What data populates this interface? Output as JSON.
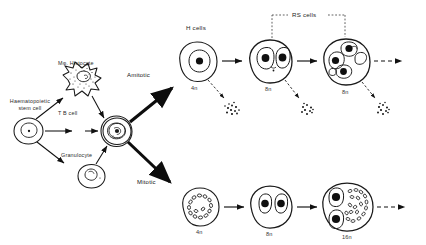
{
  "figure": {
    "type": "cell-lineage-diagram",
    "background_color": "#ffffff",
    "ink_color": "#1a1a1a"
  },
  "labels": {
    "stem_cell_line1": "Haematopoietic",
    "stem_cell_line2": "stem cell",
    "histocyte": "Mφ. Histocyte",
    "tb_cell": "T  B cell",
    "granulocyte": "Granulocyte",
    "amitotic": "Amitotic",
    "mitotic": "Mitotic",
    "h_cells": "H cells",
    "rs_cells": "RS cells"
  },
  "pathways": [
    {
      "name": "amitotic",
      "label": "Amitotic",
      "group_label": "H cells",
      "bracket_label": "RS cells",
      "stages": [
        {
          "ploidy": "4n",
          "nuclei": 1,
          "apoptotic_cluster": true
        },
        {
          "ploidy": "8n",
          "nuclei": 2,
          "apoptotic_cluster": true
        },
        {
          "ploidy": "8n",
          "nuclei": 4,
          "apoptotic_cluster": true
        }
      ]
    },
    {
      "name": "mitotic",
      "label": "Mitotic",
      "stages": [
        {
          "ploidy": "4n",
          "nuclei": 0,
          "chromosomes": true
        },
        {
          "ploidy": "8n",
          "nuclei": 2,
          "chromosomes": false
        },
        {
          "ploidy": "16n",
          "nuclei": 2,
          "chromosomes": true
        }
      ]
    }
  ],
  "ploidy": {
    "amitotic": [
      "4n",
      "8n",
      "8n"
    ],
    "mitotic": [
      "4n",
      "8n",
      "16n"
    ]
  }
}
